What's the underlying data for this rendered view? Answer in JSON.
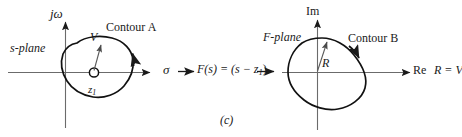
{
  "figure": {
    "caption": "(c)",
    "background_color": "#ffffff",
    "ink_color": "#1a1a1a",
    "axis_color": "#5a5a5a"
  },
  "left_plane": {
    "name": "s-plane",
    "plane_label": "s-plane",
    "vertical_axis_label": "jω",
    "horizontal_axis_label": "σ",
    "contour_label": "Contour A",
    "vector_label": "V",
    "zero_label": "z",
    "zero_subscript": "1",
    "zero_marker": "open-circle",
    "contour_direction": "clockwise"
  },
  "mapping": {
    "expression": "F(s) = (s − z",
    "expression_subscript": "1",
    "expression_tail": ")",
    "arrow_in": "→",
    "arrow_out": "→"
  },
  "right_plane": {
    "name": "F-plane",
    "plane_label": "F-plane",
    "vertical_axis_label": "Im",
    "horizontal_axis_label": "Re",
    "contour_label": "Contour B",
    "vector_label": "R",
    "relation": "R = V",
    "contour_direction": "clockwise"
  }
}
